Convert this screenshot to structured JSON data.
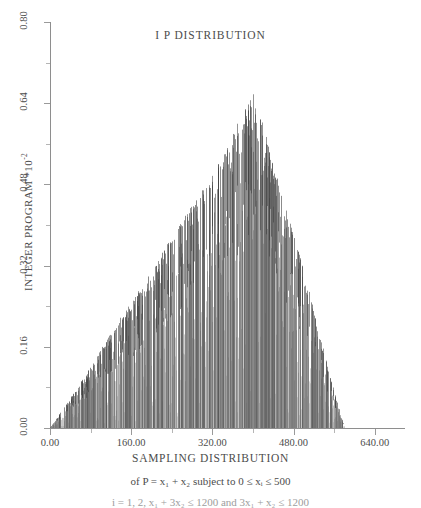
{
  "chart_data": {
    "type": "bar",
    "title": "I P DISTRIBUTION",
    "xlabel": "SAMPLING DISTRIBUTION",
    "ylabel": "INTEGER PROGRAM *10",
    "ylabel_exponent": "-2",
    "xlim": [
      0,
      680
    ],
    "ylim": [
      0,
      0.8
    ],
    "grid": false,
    "legend": null,
    "x_ticks": [
      "0.00",
      "160.00",
      "320.00",
      "480.00",
      "640.00"
    ],
    "x_tick_values": [
      0,
      160,
      320,
      480,
      640
    ],
    "y_ticks": [
      "0.00",
      "0.16",
      "0.32",
      "0.48",
      "0.64",
      "0.80"
    ],
    "y_tick_values": [
      0.0,
      0.16,
      0.32,
      0.48,
      0.64,
      0.8
    ],
    "series_name": "IP frequency spikes",
    "peak_x": 400,
    "peak_y": 0.67,
    "data_start_x": 0,
    "data_end_x": 580,
    "envelope_points": [
      {
        "x": 0,
        "y": 0.0
      },
      {
        "x": 40,
        "y": 0.06
      },
      {
        "x": 80,
        "y": 0.12
      },
      {
        "x": 120,
        "y": 0.19
      },
      {
        "x": 160,
        "y": 0.25
      },
      {
        "x": 200,
        "y": 0.31
      },
      {
        "x": 240,
        "y": 0.38
      },
      {
        "x": 280,
        "y": 0.44
      },
      {
        "x": 320,
        "y": 0.5
      },
      {
        "x": 360,
        "y": 0.58
      },
      {
        "x": 400,
        "y": 0.67
      },
      {
        "x": 420,
        "y": 0.6
      },
      {
        "x": 440,
        "y": 0.52
      },
      {
        "x": 460,
        "y": 0.45
      },
      {
        "x": 480,
        "y": 0.38
      },
      {
        "x": 500,
        "y": 0.31
      },
      {
        "x": 520,
        "y": 0.23
      },
      {
        "x": 540,
        "y": 0.15
      },
      {
        "x": 560,
        "y": 0.07
      },
      {
        "x": 580,
        "y": 0.0
      }
    ]
  },
  "caption": {
    "line1_prefix": "of P = x",
    "line1_sub1": "1",
    "line1_mid": " + x",
    "line1_sub2": "2",
    "line1_suffix": "  subject to 0 ≤ x",
    "line1_sub3": "i",
    "line1_end": " ≤ 500",
    "line1_full": "of P = x₁ + x₂  subject to 0 ≤ xᵢ ≤ 500",
    "line2_full": "i = 1, 2, x₁ + 3x₂ ≤ 1200 and 3x₁ + x₂ ≤ 1200"
  },
  "colors": {
    "background": "#ffffff",
    "axis": "#8e8e8e",
    "text": "#4c4c4c",
    "data": "#777777"
  }
}
